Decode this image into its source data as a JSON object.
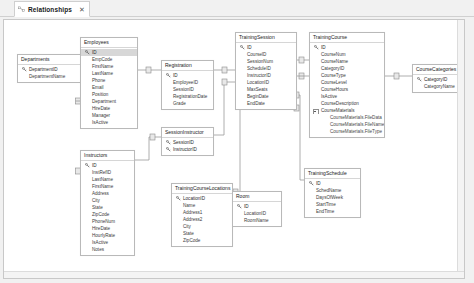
{
  "window": {
    "tab": {
      "label": "Relationships",
      "icon": "relationships-icon",
      "close_label": "✕"
    }
  },
  "diagram": {
    "tables": [
      {
        "id": "departments",
        "name": "Departments",
        "x": 13,
        "y": 34,
        "w": 64,
        "fields": [
          {
            "label": "DepartmentID",
            "key": true
          },
          {
            "label": "DepartmentName",
            "key": false
          }
        ]
      },
      {
        "id": "employees",
        "name": "Employees",
        "x": 76,
        "y": 17,
        "w": 58,
        "fields": [
          {
            "label": "ID",
            "key": true,
            "selected": true
          },
          {
            "label": "EmpCode",
            "key": false
          },
          {
            "label": "FirstName",
            "key": false
          },
          {
            "label": "LastName",
            "key": false
          },
          {
            "label": "Phone",
            "key": false
          },
          {
            "label": "Email",
            "key": false
          },
          {
            "label": "Position",
            "key": false
          },
          {
            "label": "Department",
            "key": false
          },
          {
            "label": "HireDate",
            "key": false
          },
          {
            "label": "Manager",
            "key": false
          },
          {
            "label": "IsActive",
            "key": false
          }
        ]
      },
      {
        "id": "registration",
        "name": "Registration",
        "x": 157,
        "y": 40,
        "w": 53,
        "fields": [
          {
            "label": "ID",
            "key": true
          },
          {
            "label": "EmployeeID",
            "key": false
          },
          {
            "label": "SessionID",
            "key": false
          },
          {
            "label": "RegistrationDate",
            "key": false
          },
          {
            "label": "Grade",
            "key": false
          }
        ]
      },
      {
        "id": "session-instructor",
        "name": "SessionInstructor",
        "x": 157,
        "y": 107,
        "w": 53,
        "fields": [
          {
            "label": "SessionID",
            "key": true
          },
          {
            "label": "InstructorID",
            "key": true
          }
        ]
      },
      {
        "id": "instructors",
        "name": "Instructors",
        "x": 76,
        "y": 130,
        "w": 55,
        "fields": [
          {
            "label": "ID",
            "key": true
          },
          {
            "label": "InstRefID",
            "key": false
          },
          {
            "label": "LastName",
            "key": false
          },
          {
            "label": "FirstName",
            "key": false
          },
          {
            "label": "Address",
            "key": false
          },
          {
            "label": "City",
            "key": false
          },
          {
            "label": "State",
            "key": false
          },
          {
            "label": "ZipCode",
            "key": false
          },
          {
            "label": "PhoneNum",
            "key": false
          },
          {
            "label": "HireDate",
            "key": false
          },
          {
            "label": "HourlyRate",
            "key": false
          },
          {
            "label": "IsActive",
            "key": false
          },
          {
            "label": "Notes",
            "key": false
          }
        ]
      },
      {
        "id": "training-course-locations",
        "name": "TrainingCourseLocations",
        "x": 167,
        "y": 163,
        "w": 62,
        "fields": [
          {
            "label": "LocationID",
            "key": true
          },
          {
            "label": "Name",
            "key": false
          },
          {
            "label": "Address1",
            "key": false
          },
          {
            "label": "Address2",
            "key": false
          },
          {
            "label": "City",
            "key": false
          },
          {
            "label": "State",
            "key": false
          },
          {
            "label": "ZipCode",
            "key": false
          }
        ]
      },
      {
        "id": "training-session",
        "name": "TrainingSession",
        "x": 231,
        "y": 12,
        "w": 62,
        "fields": [
          {
            "label": "ID",
            "key": true
          },
          {
            "label": "CourseID",
            "key": false
          },
          {
            "label": "SessionNum",
            "key": false
          },
          {
            "label": "ScheduleID",
            "key": false
          },
          {
            "label": "InstructorID",
            "key": false
          },
          {
            "label": "LocationID",
            "key": false
          },
          {
            "label": "MaxSeats",
            "key": false
          },
          {
            "label": "BeginDate",
            "key": false
          },
          {
            "label": "EndDate",
            "key": false
          }
        ]
      },
      {
        "id": "training-course",
        "name": "TrainingCourse",
        "x": 305,
        "y": 12,
        "w": 76,
        "fields": [
          {
            "label": "ID",
            "key": true
          },
          {
            "label": "CourseNum",
            "key": false
          },
          {
            "label": "CourseName",
            "key": false
          },
          {
            "label": "CategoryID",
            "key": false
          },
          {
            "label": "CourseType",
            "key": false
          },
          {
            "label": "CourseLevel",
            "key": false
          },
          {
            "label": "CourseHours",
            "key": false
          },
          {
            "label": "IsActive",
            "key": false
          },
          {
            "label": "CourseDescription",
            "key": false
          },
          {
            "label": "CourseMaterials",
            "key": false,
            "expander": true
          },
          {
            "label": "CourseMaterials.FileData",
            "key": false,
            "sub": true
          },
          {
            "label": "CourseMaterials.FileName",
            "key": false,
            "sub": true
          },
          {
            "label": "CourseMaterials.FileType",
            "key": false,
            "sub": true
          }
        ]
      },
      {
        "id": "course-categories",
        "name": "CourseCategories",
        "x": 408,
        "y": 44,
        "w": 52,
        "fields": [
          {
            "label": "CategoryID",
            "key": true
          },
          {
            "label": "CategoryName",
            "key": false
          }
        ]
      },
      {
        "id": "room",
        "name": "Room",
        "x": 228,
        "y": 171,
        "w": 50,
        "fields": [
          {
            "label": "ID",
            "key": true
          },
          {
            "label": "LocationID",
            "key": false
          },
          {
            "label": "RoomName",
            "key": false
          }
        ]
      },
      {
        "id": "training-schedule",
        "name": "TrainingSchedule",
        "x": 300,
        "y": 148,
        "w": 57,
        "fields": [
          {
            "label": "ID",
            "key": true
          },
          {
            "label": "SchedName",
            "key": false
          },
          {
            "label": "DaysOfWeek",
            "key": false
          },
          {
            "label": "StartTime",
            "key": false
          },
          {
            "label": "EndTime",
            "key": false
          }
        ]
      }
    ],
    "colors": {
      "line": "#9a9a9a",
      "table_border": "#b9b9b9",
      "canvas": "#ffffff",
      "chrome": "#f1f1f1",
      "selection": "#d7d7d7"
    }
  }
}
